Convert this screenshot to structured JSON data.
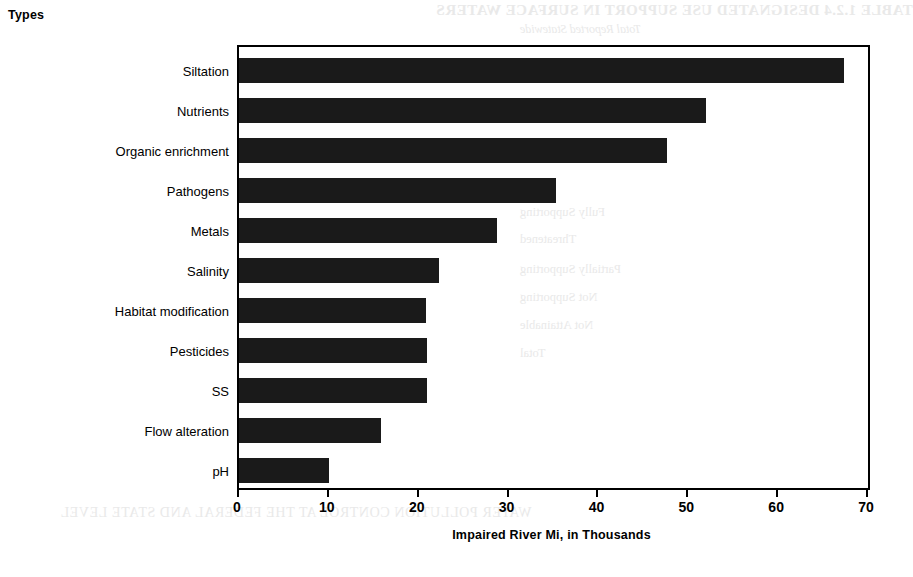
{
  "chart_data": {
    "type": "bar",
    "orientation": "horizontal",
    "title": "",
    "xlabel": "Impaired River Mi, in Thousands",
    "ylabel": "Types",
    "xlim": [
      0,
      70
    ],
    "xticks": [
      0,
      10,
      20,
      30,
      40,
      50,
      60,
      70
    ],
    "grid": false,
    "legend": null,
    "bar_color": "#1a1a1a",
    "categories": [
      "Siltation",
      "Nutrients",
      "Organic enrichment",
      "Pathogens",
      "Metals",
      "Salinity",
      "Habitat modification",
      "Pesticides",
      "SS",
      "Flow alteration",
      "pH"
    ],
    "values": [
      67.3,
      52.0,
      47.6,
      35.3,
      28.7,
      22.3,
      20.8,
      20.9,
      20.9,
      15.8,
      10.0
    ]
  },
  "axis": {
    "y_label": "Types",
    "x_label": "Impaired River Mi, in Thousands",
    "tick_labels": [
      "0",
      "10",
      "20",
      "30",
      "40",
      "50",
      "60",
      "70"
    ]
  },
  "background_artifacts": {
    "table_title": "TABLE 1.2.4   DESIGNATED USE SUPPORT IN SURFACE WATERS",
    "table_subtitle": "Total Reported Statewide",
    "rows": [
      "Designated Use",
      "Fully Supporting",
      "Threatened",
      "Partially Supporting",
      "Not Supporting",
      "Not Attainable",
      "Total"
    ],
    "numbers": [
      "141.0",
      "18.68",
      "1,013,000",
      "2,012,000",
      "2,043",
      "3,456.2",
      "9,013"
    ],
    "footer": "WATER POLLUTION CONTROL AT THE FEDERAL AND STATE LEVEL"
  }
}
